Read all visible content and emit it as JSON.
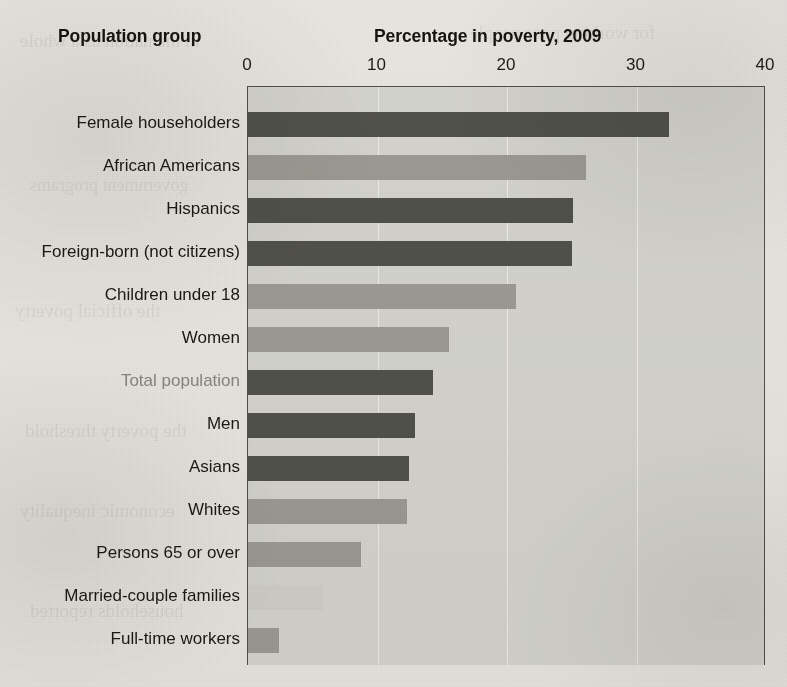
{
  "header": {
    "group_label": "Population group",
    "chart_title": "Percentage in poverty, 2009"
  },
  "axis": {
    "ticks": [
      "0",
      "10",
      "20",
      "30",
      "40"
    ]
  },
  "colors": {
    "bar_dark": "#555550",
    "bar_light": "#a3a29c",
    "bar_faint": "#d9d9d4",
    "plot_background": "#dededa",
    "axis_line": "#55534d",
    "gridline": "#ffffff",
    "text": "#1c1b15",
    "text_muted": "#8e8c85",
    "paper": "#f2f1ee"
  },
  "chart_data": {
    "type": "bar",
    "orientation": "horizontal",
    "title": "Percentage in poverty, 2009",
    "xlabel": "Percentage in poverty, 2009",
    "ylabel": "Population group",
    "xlim": [
      0,
      40
    ],
    "xticks": [
      0,
      10,
      20,
      30,
      40
    ],
    "grid": true,
    "legend": "none",
    "categories": [
      "Female householders",
      "African Americans",
      "Hispanics",
      "Foreign-born (not citizens)",
      "Children under 18",
      "Women",
      "Total population",
      "Men",
      "Asians",
      "Whites",
      "Persons 65 or over",
      "Married-couple families",
      "Full-time workers"
    ],
    "values": [
      32.5,
      26.1,
      25.1,
      25.0,
      20.7,
      15.5,
      14.3,
      12.9,
      12.4,
      12.3,
      8.7,
      5.8,
      2.4
    ],
    "bar_shades": [
      "dark",
      "light",
      "dark",
      "dark",
      "light",
      "light",
      "dark",
      "dark",
      "dark",
      "light",
      "light",
      "faint",
      "light"
    ],
    "label_muted": [
      false,
      false,
      false,
      false,
      false,
      false,
      true,
      false,
      false,
      false,
      false,
      false,
      false
    ]
  },
  "bleed_text": [
    "in the nation as a whole",
    "for working poor people",
    "government programs",
    "families below the line",
    "the official poverty",
    "measure of income and",
    "the poverty threshold",
    "in recent decades the",
    "economic inequality",
    "a larger share of total",
    "households reported",
    "social welfare policy"
  ]
}
